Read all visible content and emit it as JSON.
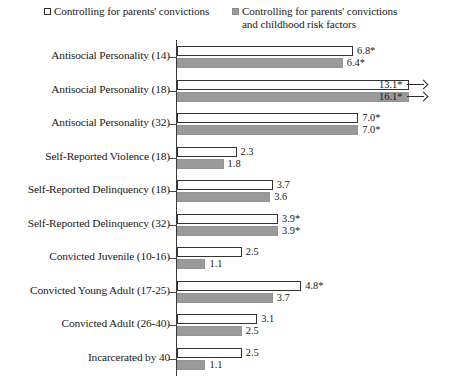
{
  "legend": {
    "entries": [
      {
        "key": "series_a",
        "label": "Controlling for parents' convictions",
        "swatch": "open-square-icon"
      },
      {
        "key": "series_b",
        "label": "Controlling for parents' convictions\nand childhood risk factors",
        "swatch": "filled-square-icon"
      }
    ]
  },
  "chart_data": {
    "type": "bar",
    "orientation": "horizontal",
    "title": "",
    "xlabel": "",
    "ylabel": "",
    "xlim": [
      0,
      11
    ],
    "grid": false,
    "legend_position": "top",
    "axis_note": "Bars truncated with arrow markers exceed the plotted x-range",
    "categories": [
      "Antisocial Personality (14)",
      "Antisocial Personality (18)",
      "Antisocial Personality (32)",
      "Self-Reported Violence (18)",
      "Self-Reported Delinquency (18)",
      "Self-Reported Delinquency (32)",
      "Convicted Juvenile (10-16)",
      "Convicted Young Adult (17-25)",
      "Convicted Adult (26-40)",
      "Incarcerated by 40"
    ],
    "series": [
      {
        "name": "Controlling for parents' convictions",
        "values": [
          6.8,
          13.1,
          7.0,
          2.3,
          3.7,
          3.9,
          2.5,
          4.8,
          3.1,
          2.5
        ],
        "labels": [
          "6.8*",
          "13.1*",
          "7.0*",
          "2.3",
          "3.7",
          "3.9*",
          "2.5",
          "4.8*",
          "3.1",
          "2.5"
        ],
        "truncated": [
          false,
          true,
          false,
          false,
          false,
          false,
          false,
          false,
          false,
          false
        ]
      },
      {
        "name": "Controlling for parents' convictions and childhood risk factors",
        "values": [
          6.4,
          16.1,
          7.0,
          1.8,
          3.6,
          3.9,
          1.1,
          3.7,
          2.5,
          1.1
        ],
        "labels": [
          "6.4*",
          "16.1*",
          "7.0*",
          "1.8",
          "3.6",
          "3.9*",
          "1.1",
          "3.7",
          "2.5",
          "1.1"
        ],
        "truncated": [
          false,
          true,
          false,
          false,
          false,
          false,
          false,
          false,
          false,
          false
        ]
      }
    ]
  }
}
